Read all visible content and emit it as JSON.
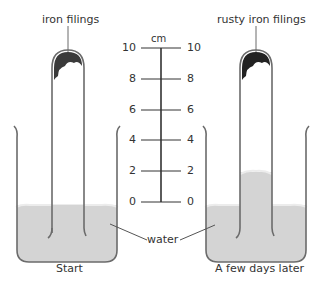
{
  "labels": {
    "left_top": "iron filings",
    "right_top": "rusty iron filings",
    "water": "water",
    "left_caption": "Start",
    "right_caption": "A few days later",
    "unit": "cm"
  },
  "scale": {
    "ticks_left": [
      "10",
      "8",
      "6",
      "4",
      "2",
      "0"
    ],
    "ticks_right": [
      "10",
      "8",
      "6",
      "4",
      "2",
      "0"
    ]
  },
  "colors": {
    "water": "#d4d4d4",
    "glass": "#6b6b6b",
    "filings": "#3a3a3a",
    "text": "#333333"
  }
}
